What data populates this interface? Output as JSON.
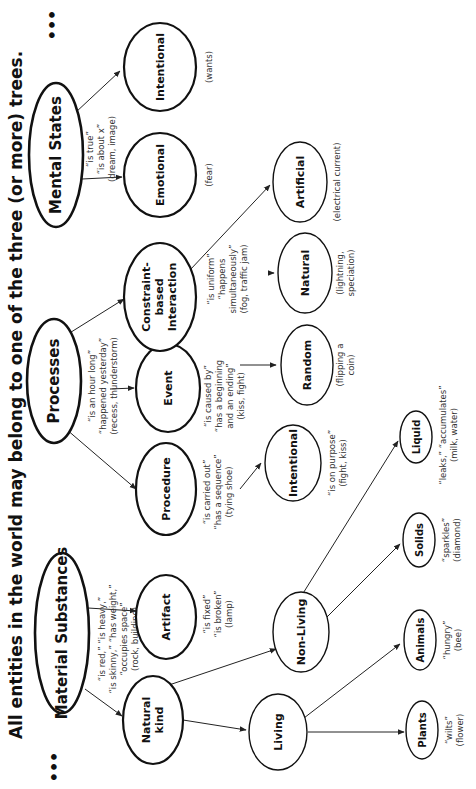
{
  "title": "All entities in the world may belong to one of the three (or more) trees.",
  "ellipsis": "•••",
  "colors": {
    "ink": "#111111",
    "background": "#ffffff"
  },
  "roots": {
    "material": {
      "label": "Material Substances",
      "annotations": [
        "“is red,” “is heavy,”",
        "“is skinny,” “has weight,”",
        "“occupies space”",
        "(rock, building)"
      ]
    },
    "processes": {
      "label": "Processes",
      "annotations": [
        "“is an hour long”",
        "“happened yesterday”",
        "(recess, thunderstorm)"
      ]
    },
    "mental": {
      "label": "Mental States",
      "annotations": [
        "“is true”",
        "“is about x”",
        "(dream, image)"
      ]
    }
  },
  "nodes": {
    "natural_kind": {
      "label_lines": [
        "Natural",
        "kind"
      ]
    },
    "artifact": {
      "label": "Artifact",
      "annotations": [
        "“is fixed”",
        "“is broken”",
        "(lamp)"
      ]
    },
    "procedure": {
      "label": "Procedure",
      "annotations": [
        "“is carried out”",
        "“has a sequence”",
        "(tying shoe)"
      ]
    },
    "event": {
      "label": "Event",
      "annotations": [
        "“is caused by”",
        "“has a beginning",
        "and an ending”",
        "(kiss, fight)"
      ]
    },
    "constraint": {
      "label_lines": [
        "Constraint-",
        "based",
        "Interaction"
      ],
      "annotations": [
        "“is uniform”",
        "“happens",
        "simultaneously”",
        "(fog, traffic jam)"
      ]
    },
    "emotional": {
      "label": "Emotional",
      "annotations": [
        "(fear)"
      ]
    },
    "intentional_ms": {
      "label": "Intentional",
      "annotations": [
        "(wants)"
      ]
    },
    "living": {
      "label": "Living"
    },
    "non_living": {
      "label": "Non-Living"
    },
    "intentional_ev": {
      "label": "Intentional",
      "annotations": [
        "“is on purpose”",
        "(fight, kiss)"
      ]
    },
    "random": {
      "label": "Random",
      "annotations": [
        "(flipping a",
        "coin)"
      ]
    },
    "natural": {
      "label": "Natural",
      "annotations": [
        "(lightning,",
        "speciation)"
      ]
    },
    "artificial": {
      "label": "Artificial",
      "annotations": [
        "(electrical current)"
      ]
    },
    "plants": {
      "label": "Plants",
      "annotations": [
        "“wilts”",
        "(flower)"
      ]
    },
    "animals": {
      "label": "Animals",
      "annotations": [
        "“hungry”",
        "(bee)"
      ]
    },
    "solids": {
      "label": "Solids",
      "annotations": [
        "“sparkles”",
        "(diamond)"
      ]
    },
    "liquid": {
      "label": "Liquid",
      "annotations": [
        "“leaks,” “accumulates”",
        "(milk, water)"
      ]
    }
  }
}
